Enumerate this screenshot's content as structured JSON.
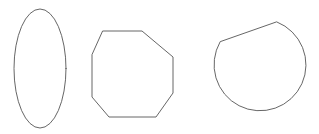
{
  "canvas": {
    "width": 319,
    "height": 134,
    "background_color": "#ffffff",
    "stroke_color": "#555555",
    "stroke_width": 0.9,
    "fill": "none"
  },
  "figure": {
    "type": "geometric-shapes",
    "shape_count": 3
  },
  "shapes": [
    {
      "id": "shape-1",
      "name": "ellipse",
      "label": "tall vertical ellipse",
      "geometry": {
        "kind": "ellipse",
        "cx": 40,
        "cy": 68.5,
        "rx": 26,
        "ry": 59.5,
        "bbox": {
          "x": 14,
          "y": 9,
          "width": 52,
          "height": 119
        }
      },
      "stroke_color": "#555555",
      "stroke_width": 0.9
    },
    {
      "id": "shape-2",
      "name": "octagon",
      "label": "irregular octagon",
      "geometry": {
        "kind": "polygon",
        "sides": 8,
        "points": [
          [
            103,
            31
          ],
          [
            142,
            31
          ],
          [
            173,
            57
          ],
          [
            173,
            93
          ],
          [
            156,
            117
          ],
          [
            109,
            117
          ],
          [
            92,
            97
          ],
          [
            92,
            55
          ]
        ],
        "bbox": {
          "x": 92,
          "y": 31,
          "width": 81,
          "height": 86
        }
      },
      "stroke_color": "#555555",
      "stroke_width": 0.9
    },
    {
      "id": "shape-3",
      "name": "truncated-circle",
      "label": "circle with flat chord cut across upper-left",
      "geometry": {
        "kind": "circle-with-chord",
        "cx": 257,
        "cy": 76,
        "r": 46,
        "chord_start": [
          220,
          42
        ],
        "chord_end": [
          277,
          22
        ],
        "bbox": {
          "x": 211,
          "y": 22,
          "width": 92,
          "height": 100
        }
      },
      "stroke_color": "#555555",
      "stroke_width": 0.9
    }
  ]
}
